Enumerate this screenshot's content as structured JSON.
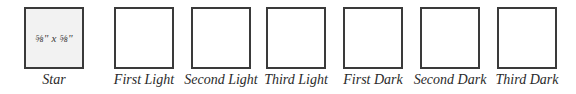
{
  "swatches": [
    {
      "label": "Star",
      "box_text": "⅝\" x ⅝\"",
      "fill": "#f2f2f2",
      "x": 24
    },
    {
      "label": "First Light",
      "box_text": "",
      "fill": "#ffffff",
      "x": 114
    },
    {
      "label": "Second Light",
      "box_text": "",
      "fill": "#ffffff",
      "x": 191
    },
    {
      "label": "Third Light",
      "box_text": "",
      "fill": "#ffffff",
      "x": 266
    },
    {
      "label": "First Dark",
      "box_text": "",
      "fill": "#ffffff",
      "x": 343
    },
    {
      "label": "Second Dark",
      "box_text": "",
      "fill": "#ffffff",
      "x": 420
    },
    {
      "label": "Third Dark",
      "box_text": "",
      "fill": "#ffffff",
      "x": 497
    }
  ],
  "colors": {
    "border": "#3a3a3a",
    "star_fill": "#f2f2f2",
    "text": "#2a2a2a"
  }
}
